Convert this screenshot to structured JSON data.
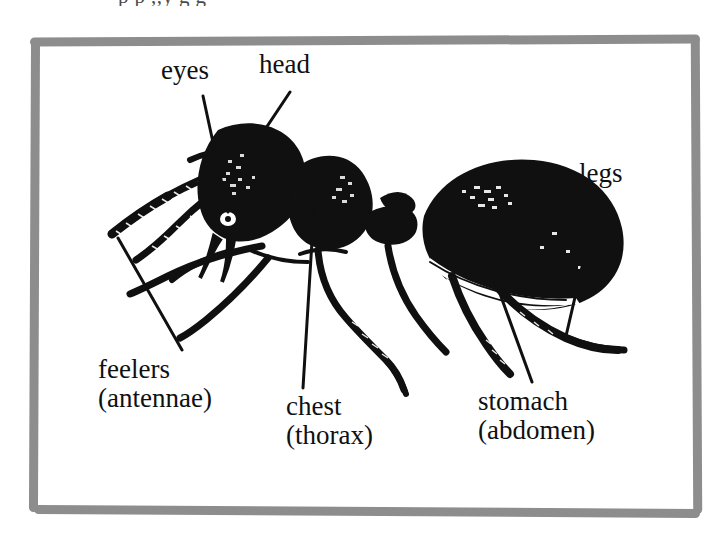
{
  "figure": {
    "subject": "ant",
    "clipped_top_text": "p p ,,y g g",
    "background_color": "#ffffff",
    "ink_color": "#101010",
    "frame_color": "#8d8d8d"
  },
  "labels": [
    {
      "id": "eyes",
      "line1": "eyes",
      "line2": ""
    },
    {
      "id": "head",
      "line1": "head",
      "line2": ""
    },
    {
      "id": "legs",
      "line1": "legs",
      "line2": ""
    },
    {
      "id": "feelers",
      "line1": "feelers",
      "line2": "(antennae)"
    },
    {
      "id": "chest",
      "line1": "chest",
      "line2": "(thorax)"
    },
    {
      "id": "stomach",
      "line1": "stomach",
      "line2": "(abdomen)"
    }
  ]
}
